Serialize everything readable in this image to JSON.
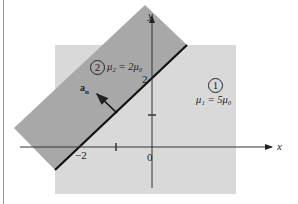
{
  "figure": {
    "axes": {
      "x_label": "x",
      "y_label": "y",
      "origin_label": "0",
      "x_tick_label": "−2",
      "y_tick_label": "2"
    },
    "regions": [
      {
        "id": "1",
        "circle_label": "1",
        "permeability": "μ₁ = 5μ₀",
        "fill": "#d9d9d9"
      },
      {
        "id": "2",
        "circle_label": "2",
        "permeability": "μ₂ = 2μ₀",
        "fill": "#a8a8a8"
      }
    ],
    "normal_vector": {
      "label": "a",
      "subscript": "n"
    },
    "boundary_line_color": "#111111",
    "axis_color": "#333333"
  }
}
